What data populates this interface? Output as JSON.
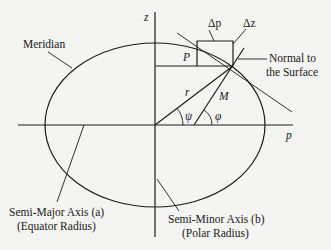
{
  "diagram": {
    "type": "ellipsoid-meridian-geometry",
    "axes": {
      "vertical_label": "z",
      "horizontal_label": "p"
    },
    "labels": {
      "meridian": "Meridian",
      "normal_line1": "Normal to",
      "normal_line2": "the Surface",
      "semi_major_line1": "Semi-Major Axis (a)",
      "semi_major_line2": "(Equator Radius)",
      "semi_minor_line1": "Semi-Minor Axis (b)",
      "semi_minor_line2": "(Polar Radius)",
      "delta_p": "Δp",
      "delta_z": "Δz",
      "P": "P",
      "r": "r",
      "M": "M",
      "psi": "ψ",
      "phi": "φ"
    },
    "colors": {
      "background": "#f4f4f2",
      "ink": "#1c1c1c"
    }
  }
}
